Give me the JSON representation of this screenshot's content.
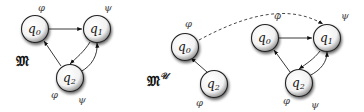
{
  "diagram": {
    "models": [
      {
        "name": "𝔐",
        "superscript": "",
        "nodes": [
          {
            "id": "q0",
            "base": "q",
            "sub": "0",
            "props": [
              "φ"
            ]
          },
          {
            "id": "q1",
            "base": "q",
            "sub": "1",
            "props": [
              "ψ"
            ]
          },
          {
            "id": "q2",
            "base": "q",
            "sub": "2",
            "props": [
              "φ",
              "ψ"
            ]
          }
        ],
        "edges": [
          {
            "from": "q0",
            "to": "q1",
            "style": "solid"
          },
          {
            "from": "q1",
            "to": "q2",
            "style": "solid"
          },
          {
            "from": "q2",
            "to": "q1",
            "style": "solid"
          },
          {
            "from": "q2",
            "to": "q0",
            "style": "solid"
          }
        ]
      },
      {
        "name": "𝔐",
        "superscript": "𝒰",
        "nodes": [
          {
            "id": "q0",
            "base": "q",
            "sub": "0",
            "props": [
              "φ"
            ]
          },
          {
            "id": "q2",
            "base": "q",
            "sub": "2",
            "props": [
              "φ"
            ]
          },
          {
            "id": "q0'",
            "base": "q",
            "sub": "0",
            "props": [
              "φ"
            ]
          },
          {
            "id": "q1'",
            "base": "q",
            "sub": "1",
            "props": [
              "ψ"
            ]
          },
          {
            "id": "q2'",
            "base": "q",
            "sub": "2",
            "props": [
              "φ",
              "ψ"
            ]
          }
        ],
        "edges": [
          {
            "from": "q2",
            "to": "q0",
            "style": "solid"
          },
          {
            "from": "q0",
            "to": "q1'",
            "style": "dashed"
          },
          {
            "from": "q0'",
            "to": "q1'",
            "style": "solid"
          },
          {
            "from": "q1'",
            "to": "q2'",
            "style": "solid"
          },
          {
            "from": "q2'",
            "to": "q1'",
            "style": "solid"
          },
          {
            "from": "q2'",
            "to": "q0'",
            "style": "solid"
          }
        ]
      }
    ]
  },
  "labels": {
    "m_left": "𝔐",
    "m_right": "𝔐",
    "m_right_sup": "𝒰",
    "q": "q",
    "s0": "0",
    "s1": "1",
    "s2": "2",
    "phi": "φ",
    "psi": "ψ"
  }
}
